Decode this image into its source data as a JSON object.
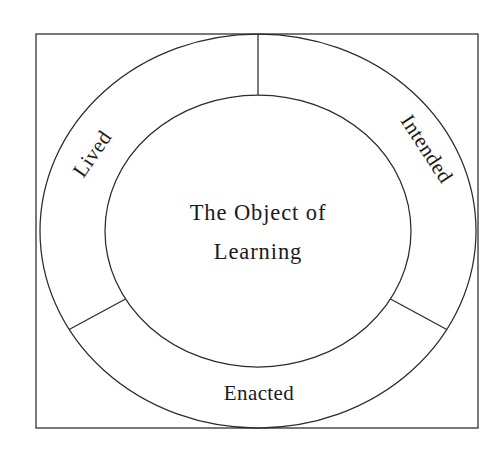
{
  "figure": {
    "title_center": {
      "line1": "The Object of",
      "line2": "Learning"
    },
    "segments": [
      {
        "id": "intended",
        "label": "Intended",
        "position": "upper-right",
        "rotation_deg": 57,
        "start_angle_deg": -90,
        "end_angle_deg": 30
      },
      {
        "id": "enacted",
        "label": "Enacted",
        "position": "bottom",
        "rotation_deg": 0,
        "start_angle_deg": 30,
        "end_angle_deg": 150
      },
      {
        "id": "lived",
        "label": "Lived",
        "position": "upper-left",
        "rotation_deg": -55,
        "start_angle_deg": 150,
        "end_angle_deg": 270
      }
    ],
    "geometry": {
      "center_x": 258,
      "center_y": 231,
      "outer_rx": 218,
      "outer_ry": 197,
      "inner_rx": 153,
      "inner_ry": 136,
      "frame_x": 36,
      "frame_y": 34,
      "frame_width": 442,
      "frame_height": 394
    },
    "colors": {
      "background": "#ffffff",
      "stroke": "#2b2b2b",
      "frame_stroke": "#404040",
      "text": "#1a1a1a"
    }
  }
}
